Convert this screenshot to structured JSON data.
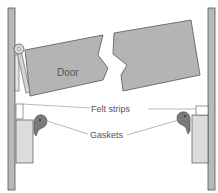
{
  "diagram": {
    "labels": {
      "door": "Door",
      "felt_strips": "Felt strips",
      "gaskets": "Gaskets"
    },
    "colors": {
      "background": "#ffffff",
      "door_fill": "#b4b4b4",
      "post_fill": "#b9b9b9",
      "jamb_fill": "#d9d9d9",
      "gasket_fill": "#7a7a7a",
      "outline": "#555555",
      "leader_line": "#8a8a8a",
      "label_text": "#555555"
    }
  }
}
